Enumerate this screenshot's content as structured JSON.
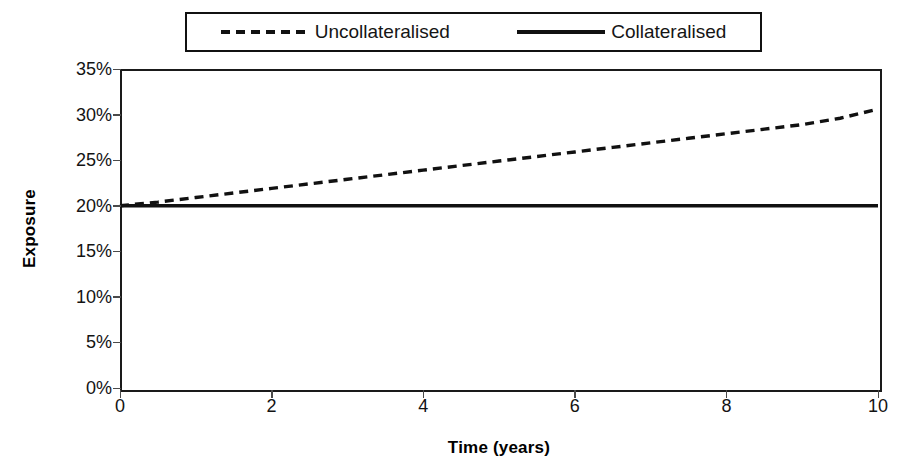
{
  "chart_data": {
    "type": "line",
    "title": "",
    "xlabel": "Time (years)",
    "ylabel": "Exposure",
    "xlim": [
      0,
      10
    ],
    "ylim": [
      0,
      35
    ],
    "x_ticks": [
      0,
      2,
      4,
      6,
      8,
      10
    ],
    "x_tick_labels": [
      "0",
      "2",
      "4",
      "6",
      "8",
      "10"
    ],
    "y_ticks": [
      0,
      5,
      10,
      15,
      20,
      25,
      30,
      35
    ],
    "y_tick_labels": [
      "0%",
      "5%",
      "10%",
      "15%",
      "20%",
      "25%",
      "30%",
      "35%"
    ],
    "grid": false,
    "legend_position": "top-center",
    "x": [
      0,
      0.5,
      1,
      1.5,
      2,
      2.5,
      3,
      3.5,
      4,
      4.5,
      5,
      5.5,
      6,
      6.5,
      7,
      7.5,
      8,
      8.5,
      9,
      9.5,
      10
    ],
    "series": [
      {
        "name": "Uncollateralised",
        "style": "dashed",
        "color": "#111111",
        "values": [
          20.0,
          20.4,
          20.9,
          21.4,
          21.9,
          22.4,
          22.9,
          23.4,
          23.9,
          24.4,
          24.9,
          25.4,
          25.9,
          26.4,
          26.9,
          27.4,
          27.9,
          28.4,
          28.9,
          29.6,
          30.6
        ]
      },
      {
        "name": "Collateralised",
        "style": "solid",
        "color": "#111111",
        "values": [
          20.0,
          20.0,
          20.0,
          20.0,
          20.0,
          20.0,
          20.0,
          20.0,
          20.0,
          20.0,
          20.0,
          20.0,
          20.0,
          20.0,
          20.0,
          20.0,
          20.0,
          20.0,
          20.0,
          20.0,
          20.0
        ]
      }
    ]
  },
  "legend": {
    "entries": [
      {
        "label": "Uncollateralised",
        "style": "dashed"
      },
      {
        "label": "Collateralised",
        "style": "solid"
      }
    ]
  },
  "axes": {
    "y_title": "Exposure",
    "x_title": "Time (years)"
  },
  "colors": {
    "line": "#111111",
    "frame": "#1a1a1a",
    "background": "#ffffff",
    "tick": "#4a4a4a"
  }
}
